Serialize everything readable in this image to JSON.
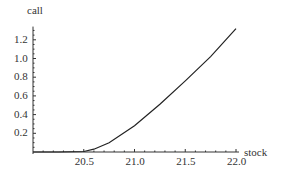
{
  "chart_data": {
    "type": "line",
    "title": "",
    "xlabel": "stock",
    "ylabel": "call",
    "xlim": [
      20.0,
      22.0
    ],
    "ylim": [
      0,
      1.32
    ],
    "xticks": [
      20.5,
      21.0,
      21.5,
      22.0
    ],
    "xtick_labels": [
      "20.5",
      "21.0",
      "21.5",
      "22.0"
    ],
    "yticks": [
      0.2,
      0.4,
      0.6,
      0.8,
      1.0,
      1.2
    ],
    "ytick_labels": [
      "0.2",
      "0.4",
      "0.6",
      "0.8",
      "1.0",
      "1.2"
    ],
    "grid": false,
    "legend": null,
    "series": [
      {
        "name": "call",
        "color": "#222222",
        "x": [
          20.0,
          20.25,
          20.5,
          20.6,
          20.75,
          21.0,
          21.25,
          21.5,
          21.75,
          22.0
        ],
        "y": [
          0.0,
          0.0,
          0.005,
          0.03,
          0.1,
          0.28,
          0.51,
          0.76,
          1.02,
          1.32
        ]
      }
    ]
  }
}
